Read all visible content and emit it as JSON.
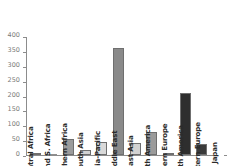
{
  "chart_data": {
    "type": "bar",
    "title": "",
    "xlabel": "",
    "ylabel": "",
    "ylim": [
      0,
      400
    ],
    "ytick_labels": [
      "400",
      "350",
      "300",
      "250",
      "200",
      "150",
      "100",
      "50",
      "0"
    ],
    "ytick_values": [
      400,
      350,
      300,
      250,
      200,
      150,
      100,
      50,
      0
    ],
    "grid": false,
    "legend": "none",
    "categories": [
      "Central Africa",
      "E. and S. Africa",
      "Northern Africa",
      "South Asia",
      "Asia-Pacific",
      "Middle East",
      "East Asia",
      "South America",
      "Eastern Europe",
      "North America",
      "Western Europe",
      "Japan"
    ],
    "values": [
      6,
      3,
      54,
      18,
      43,
      360,
      42,
      77,
      8,
      208,
      37,
      1
    ],
    "bar_colors": [
      "#8f8f8f",
      "#8f8f8f",
      "#9b9b9b",
      "#d2d2d2",
      "#d9d9d9",
      "#8a8a8a",
      "#d2d2d2",
      "#9b9b9b",
      "#b5b5b5",
      "#2e2e2e",
      "#3a3a3a",
      "#ffffff"
    ],
    "axis_color": "#8c8c8c",
    "tick_label_color": "#7a7a7a",
    "bar_label_color": "#2b2b2b",
    "background": "#ffffff"
  }
}
